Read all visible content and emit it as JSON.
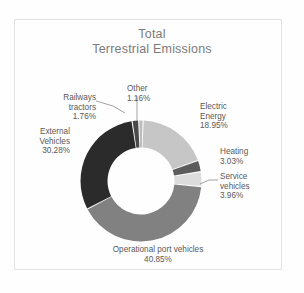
{
  "title": {
    "line1": "Total",
    "line2": "Terrestrial Emissions"
  },
  "chart_data": {
    "type": "pie",
    "variant": "donut",
    "title": "Total Terrestrial Emissions",
    "unit": "%",
    "legend": "none",
    "labels_position": "outside-with-leader-lines",
    "categories": [
      "Electric Energy",
      "Heating",
      "Service vehicles",
      "Operational port vehicles",
      "External Vehicles",
      "Railways tractors",
      "Other"
    ],
    "values": [
      18.95,
      3.03,
      3.96,
      40.85,
      30.28,
      1.76,
      1.16
    ],
    "colors": [
      "#c6c6c6",
      "#5c5c5c",
      "#dcdcdc",
      "#818181",
      "#2b2b2b",
      "#4a4a4a",
      "#bcbcbc"
    ],
    "slices": [
      {
        "name": "Electric Energy",
        "value": 18.95,
        "label_line1": "Electric",
        "label_line2": "Energy",
        "value_text": "18.95%",
        "color": "#c6c6c6"
      },
      {
        "name": "Heating",
        "value": 3.03,
        "label_line1": "Heating",
        "label_line2": "",
        "value_text": "3.03%",
        "color": "#5c5c5c"
      },
      {
        "name": "Service vehicles",
        "value": 3.96,
        "label_line1": "Service",
        "label_line2": "vehicles",
        "value_text": "3.96%",
        "color": "#dcdcdc"
      },
      {
        "name": "Operational port vehicles",
        "value": 40.85,
        "label_line1": "Operational port vehicles",
        "label_line2": "",
        "value_text": "40.85%",
        "color": "#818181"
      },
      {
        "name": "External Vehicles",
        "value": 30.28,
        "label_line1": "External",
        "label_line2": "Vehicles",
        "value_text": "30.28%",
        "color": "#2b2b2b"
      },
      {
        "name": "Railways tractors",
        "value": 1.76,
        "label_line1": "Railways",
        "label_line2": "tractors",
        "value_text": "1.76%",
        "color": "#4a4a4a"
      },
      {
        "name": "Other",
        "value": 1.16,
        "label_line1": "Other",
        "label_line2": "",
        "value_text": "1.16%",
        "color": "#bcbcbc"
      }
    ]
  },
  "style": {
    "background": "#fefefe",
    "frame_border": "#e2e2e2",
    "title_color": "#7b7b7b",
    "label_color": "#595959",
    "leader_line_color": "#8a8a8a",
    "slice_gap_color": "#ffffff"
  }
}
